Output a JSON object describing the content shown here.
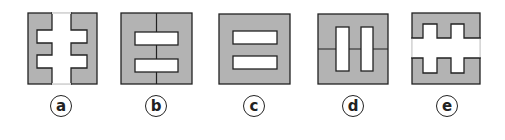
{
  "figures": [
    {
      "id": "a",
      "label": "a",
      "description": "gray square with white cross-like vertical shape having two pairs of side arms"
    },
    {
      "id": "b",
      "label": "b",
      "description": "gray square split by vertical center line with two white horizontal rectangles"
    },
    {
      "id": "c",
      "label": "c",
      "description": "gray square with two white horizontal rectangles"
    },
    {
      "id": "d",
      "label": "d",
      "description": "gray square split by horizontal center line with two white vertical rectangles"
    },
    {
      "id": "e",
      "label": "e",
      "description": "gray square with white horizontal band having two notches up and two down"
    }
  ],
  "colors": {
    "fill": "#b3b3b3",
    "stroke": "#222222",
    "hole": "#ffffff"
  }
}
